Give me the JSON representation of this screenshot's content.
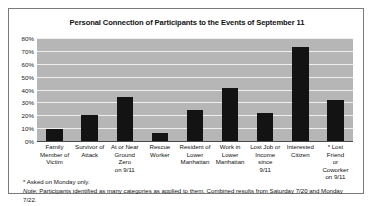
{
  "chart_data": {
    "type": "bar",
    "title": "Personal Connection of Participants to the Events of September 11",
    "xlabel": "",
    "ylabel": "",
    "ylim": [
      0,
      80
    ],
    "ytick_suffix": "%",
    "yticks": [
      0,
      10,
      20,
      30,
      40,
      50,
      60,
      70,
      80
    ],
    "ytick_labels": [
      "0%",
      "10%",
      "20%",
      "30%",
      "40%",
      "50%",
      "60%",
      "70%",
      "80%"
    ],
    "grid": true,
    "legend": "none",
    "categories": [
      "Family Member of Victim",
      "Survivor of Attack",
      "At or Near Ground Zero on 9/11",
      "Rescue Worker",
      "Resident of Lower Manhattan",
      "Work in Lower Manhattan",
      "Lost Job or Income since 9/11",
      "Interested Citizen",
      "* Lost Friend or Coworker on 9/11"
    ],
    "category_lines": [
      [
        "Family",
        "Member of",
        "Victim"
      ],
      [
        "Survivor of",
        "Attack"
      ],
      [
        "At or Near",
        "Ground Zero",
        "on 9/11"
      ],
      [
        "Rescue",
        "Worker"
      ],
      [
        "Resident of",
        "Lower",
        "Manhattan"
      ],
      [
        "Work in",
        "Lower",
        "Manhattan"
      ],
      [
        "Lost Job or",
        "Income since",
        "9/11"
      ],
      [
        "Interested",
        "Citizen"
      ],
      [
        "* Lost Friend",
        "or Coworker",
        "on 9/11"
      ]
    ],
    "values": [
      9,
      20,
      34,
      6,
      24,
      41,
      22,
      73,
      32
    ],
    "bar_color": "#131313",
    "plot_background": "#b6b6b6",
    "gridline_color": "#efefef"
  },
  "footnotes": {
    "asterisk": "* Asked on Monday only.",
    "note_label": "Note:",
    "note_body": " Participants identified as many categories as applied to them. Combined results from Saturday 7/20 and Monday 7/22."
  }
}
